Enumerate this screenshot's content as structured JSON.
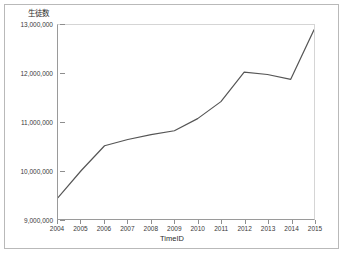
{
  "chart_data": {
    "type": "line",
    "title": "生徒数",
    "xlabel": "TimeID",
    "ylabel": "生徒数",
    "x": [
      2004,
      2005,
      2006,
      2007,
      2008,
      2009,
      2010,
      2011,
      2012,
      2013,
      2014,
      2015
    ],
    "categories": [
      "2004",
      "2005",
      "2006",
      "2007",
      "2008",
      "2009",
      "2010",
      "2011",
      "2012",
      "2013",
      "2014",
      "2015"
    ],
    "values": [
      9440000,
      10000000,
      10510000,
      10640000,
      10740000,
      10820000,
      11070000,
      11420000,
      12030000,
      11980000,
      11880000,
      12900000
    ],
    "series": [
      {
        "name": "生徒数",
        "values": [
          9440000,
          10000000,
          10510000,
          10640000,
          10740000,
          10820000,
          11070000,
          11420000,
          12030000,
          11980000,
          11880000,
          12900000
        ]
      }
    ],
    "ylim": [
      9000000,
      13000000
    ],
    "xlim": [
      2004,
      2015
    ],
    "yticks": [
      9000000,
      10000000,
      11000000,
      12000000,
      13000000
    ],
    "ytick_labels": [
      "9,000,000",
      "10,000,000",
      "11,000,000",
      "12,000,000",
      "13,000,000"
    ],
    "xticks": [
      2004,
      2005,
      2006,
      2007,
      2008,
      2009,
      2010,
      2011,
      2012,
      2013,
      2014,
      2015
    ],
    "xtick_labels": [
      "2004",
      "2005",
      "2006",
      "2007",
      "2008",
      "2009",
      "2010",
      "2011",
      "2012",
      "2013",
      "2014",
      "2015"
    ],
    "grid": false,
    "legend": null,
    "line_color": "#555555",
    "line_width": 1.2,
    "markers": false,
    "background": "#ffffff",
    "frame_color": "#b9b9b9"
  },
  "axes": {
    "y_title": "生徒数",
    "x_title": "TimeID"
  }
}
